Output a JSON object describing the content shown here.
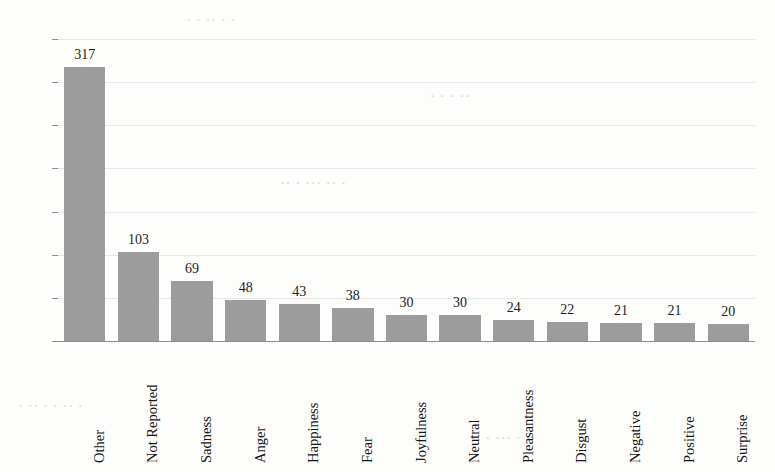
{
  "chart_data": {
    "type": "bar",
    "title": "",
    "subtitle": "",
    "xlabel": "",
    "ylabel": "",
    "categories": [
      "Other",
      "Not Reported",
      "Sadness",
      "Anger",
      "Happiness",
      "Fear",
      "Joyfulness",
      "Neutral",
      "Pleasantness",
      "Disgust",
      "Negative",
      "Positive",
      "Surprise"
    ],
    "values": [
      317,
      103,
      69,
      48,
      43,
      38,
      30,
      30,
      24,
      22,
      21,
      21,
      20
    ],
    "ylim": [
      0,
      350
    ],
    "yticks": [
      0,
      50,
      100,
      150,
      200,
      250,
      300,
      350
    ],
    "ytick_labels": [
      "0",
      "50",
      "100",
      "150",
      "200",
      "250",
      "300",
      "350"
    ],
    "data_labels": [
      "317",
      "103",
      "69",
      "48",
      "43",
      "38",
      "30",
      "30",
      "24",
      "22",
      "21",
      "21",
      "20"
    ],
    "grid": true,
    "grid_axis": "y",
    "legend": false,
    "legend_position": "none",
    "bar_color": "#9c9c9c",
    "grid_color": "#e7e7e7",
    "axis_color": "#8d8d8d",
    "text_color": "#1b1b1b",
    "background_color": "#fdfdfc",
    "xtick_rotation": 90
  },
  "page_artifacts": {
    "bleed_text": [
      "· ·  ·· · ·",
      " ·  ·    ·  ··",
      "··  · ···   ·· ·",
      "·  ··  ·   · ·· ·",
      "·· ·  ··· ·   ··"
    ]
  }
}
